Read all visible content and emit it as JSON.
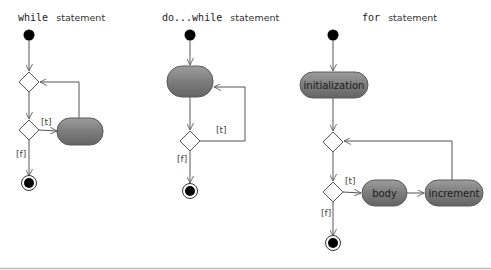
{
  "diagrams": {
    "while": {
      "title_keyword": "while",
      "title_rest": "statement",
      "guard_true": "[t]",
      "guard_false": "[f]",
      "activity_label": ""
    },
    "do_while": {
      "title_keyword": "do...while",
      "title_rest": "statement",
      "guard_true": "[t]",
      "guard_false": "[f]",
      "activity_label": ""
    },
    "for": {
      "title_keyword": "for",
      "title_rest": "statement",
      "initialization_label": "initialization",
      "body_label": "body",
      "increment_label": "increment",
      "guard_true": "[t]",
      "guard_false": "[f]"
    }
  },
  "colors": {
    "activity_fill": "#7a7a7a",
    "activity_highlight": "#9a9a9a",
    "activity_border": "#5a5a5a",
    "node_fill": "#000000",
    "line": "#555555"
  }
}
